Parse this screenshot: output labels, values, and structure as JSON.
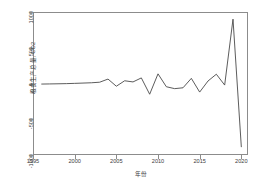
{
  "chart_data": {
    "type": "line",
    "title": "",
    "xlabel": "年份",
    "ylabel": "粮食生产总量, CO2",
    "xlim": [
      1995.0,
      2020.8
    ],
    "ylim": [
      -1000,
      1000
    ],
    "xticks": [
      1995,
      2000,
      2005,
      2010,
      2015,
      2020
    ],
    "xtick_labels": [
      "1995",
      "2000",
      "2005",
      "2010",
      "2015",
      "2020"
    ],
    "yticks": [
      1000,
      500,
      0,
      -500,
      -1000
    ],
    "ytick_labels": [
      "1000",
      "500",
      "0",
      "-500",
      "-1000"
    ],
    "grid": false,
    "legend": null,
    "line_color": "#4a4a4a",
    "frame_color": "#8c8c8c",
    "background": "#ffffff",
    "x": [
      1996,
      1997,
      1998,
      1999,
      2000,
      2001,
      2002,
      2003,
      2004,
      2005,
      2006,
      2007,
      2008,
      2009,
      2010,
      2011,
      2012,
      2013,
      2014,
      2015,
      2016,
      2017,
      2018,
      2019,
      2020
    ],
    "series": [
      {
        "name": "粮食生产总量, CO2",
        "values": [
          -8,
          -6,
          -4,
          -2,
          2,
          6,
          10,
          18,
          62,
          -38,
          38,
          22,
          78,
          -150,
          135,
          -45,
          -72,
          -60,
          72,
          -120,
          35,
          130,
          -22,
          900,
          -890
        ]
      }
    ]
  },
  "axes": {
    "x_axis_name": "year-axis",
    "y_axis_name": "value-axis"
  }
}
